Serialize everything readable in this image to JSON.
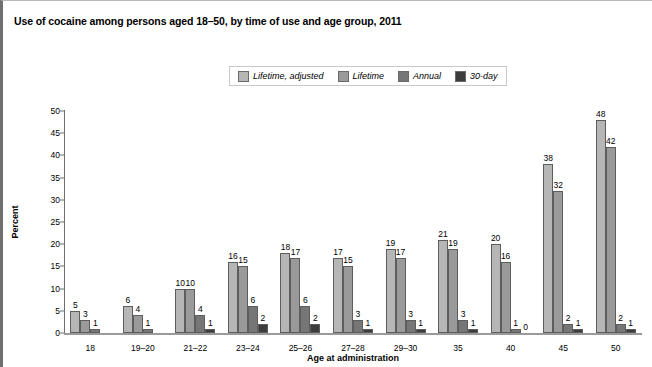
{
  "figure": {
    "title": "Use of cocaine among persons aged 18–50, by time of use and age group, 2011"
  },
  "legend": {
    "position": "top-center",
    "items": [
      {
        "label": "Lifetime, adjusted",
        "color": "#b6b6b6"
      },
      {
        "label": "Lifetime",
        "color": "#9a9a9a"
      },
      {
        "label": "Annual",
        "color": "#767676"
      },
      {
        "label": "30-day",
        "color": "#3c3c3c"
      }
    ]
  },
  "chart_data": {
    "type": "bar",
    "title": "Use of cocaine among persons aged 18–50, by time of use and age group, 2011",
    "xlabel": "Age at administration",
    "ylabel": "Percent",
    "ylim": [
      0,
      50
    ],
    "yticks": [
      0,
      5,
      10,
      15,
      20,
      25,
      30,
      35,
      40,
      45,
      50
    ],
    "grid": false,
    "legend_position": "top-center",
    "categories": [
      "18",
      "19–20",
      "21–22",
      "23–24",
      "25–26",
      "27–28",
      "29–30",
      "35",
      "40",
      "45",
      "50"
    ],
    "series": [
      {
        "name": "Lifetime, adjusted",
        "color": "#b6b6b6",
        "values": [
          5,
          6,
          10,
          16,
          18,
          17,
          19,
          21,
          20,
          38,
          48
        ]
      },
      {
        "name": "Lifetime",
        "color": "#9a9a9a",
        "values": [
          3,
          4,
          10,
          15,
          17,
          15,
          17,
          19,
          16,
          32,
          42
        ]
      },
      {
        "name": "Annual",
        "color": "#767676",
        "values": [
          1,
          1,
          4,
          6,
          6,
          3,
          3,
          3,
          1,
          2,
          2
        ]
      },
      {
        "name": "30-day",
        "color": "#3c3c3c",
        "values": [
          0,
          0,
          1,
          2,
          2,
          1,
          1,
          1,
          0,
          1,
          1
        ]
      }
    ],
    "labels": {
      "18": [
        "5",
        "3",
        "1",
        ""
      ],
      "19–20": [
        "6",
        "4",
        "1",
        ""
      ],
      "21–22": [
        "10",
        "10",
        "4",
        "1"
      ],
      "23–24": [
        "16",
        "15",
        "6",
        "2"
      ],
      "25–26": [
        "18",
        "17",
        "6",
        "2"
      ],
      "27–28": [
        "17",
        "15",
        "3",
        "1"
      ],
      "29–30": [
        "19",
        "17",
        "3",
        "1"
      ],
      "35": [
        "21",
        "19",
        "3",
        "1"
      ],
      "40": [
        "20",
        "16",
        "1",
        "0"
      ],
      "45": [
        "38",
        "32",
        "2",
        "1"
      ],
      "50": [
        "48",
        "42",
        "2",
        "1"
      ]
    }
  }
}
